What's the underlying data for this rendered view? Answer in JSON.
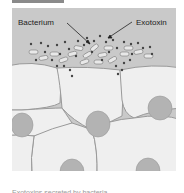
{
  "figure": {
    "labels": {
      "bacterium": "Bacterium",
      "exotoxin": "Exotoxin"
    },
    "colors": {
      "background": "#c9c9c9",
      "cell_fill": "#efefef",
      "cell_border": "#9a9a9a",
      "nucleus": "#b3b3b3",
      "toxin_dot": "#444444",
      "bacterium_fill": "#e8e8e8",
      "header_tab": "#8a8a8a"
    }
  },
  "caption": {
    "text": "Exotoxins secreted by bacteria"
  }
}
